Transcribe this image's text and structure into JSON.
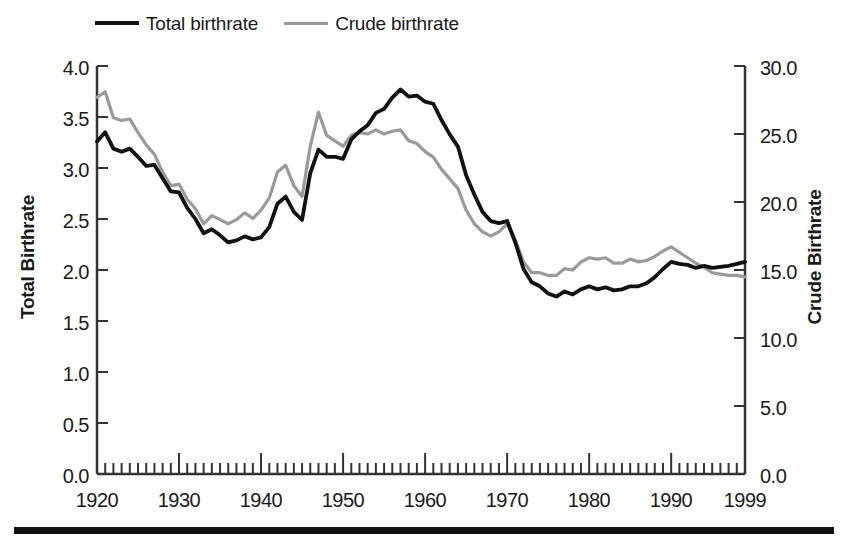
{
  "figure": {
    "background": "#ffffff",
    "bottom_rule_color": "#111111"
  },
  "legend": {
    "position": "top-left",
    "entries": [
      {
        "label": "Total birthrate",
        "color": "#111111",
        "swatch": "line-solid-black"
      },
      {
        "label": "Crude birthrate",
        "color": "#9a9a9a",
        "swatch": "line-solid-gray"
      }
    ]
  },
  "axes": {
    "y_left": {
      "title": "Total Birthrate",
      "ticks": [
        "0.0",
        "0.5",
        "1.0",
        "1.5",
        "2.0",
        "2.5",
        "3.0",
        "3.5",
        "4.0"
      ],
      "min": 0.0,
      "max": 4.0,
      "step": 0.5
    },
    "y_right": {
      "title": "Crude Birthrate",
      "ticks": [
        "0.0",
        "5.0",
        "10.0",
        "15.0",
        "20.0",
        "25.0",
        "30.0"
      ],
      "min": 0.0,
      "max": 30.0,
      "step": 5.0
    },
    "x": {
      "title": "",
      "ticks": [
        "1920",
        "1930",
        "1940",
        "1950",
        "1960",
        "1970",
        "1980",
        "1990",
        "1999"
      ],
      "min": 1920,
      "max": 1999,
      "minor_tick_interval": 1,
      "major_tick_interval": 10
    }
  },
  "chart_data": {
    "type": "line",
    "title": "",
    "subtitle": "",
    "xlabel": "",
    "ylabel": "Total Birthrate",
    "y2label": "Crude Birthrate",
    "xlim": [
      1920,
      1999
    ],
    "ylim": [
      0.0,
      4.0
    ],
    "y2lim": [
      0.0,
      30.0
    ],
    "grid": false,
    "legend_position": "top-left",
    "x": [
      1920,
      1921,
      1922,
      1923,
      1924,
      1925,
      1926,
      1927,
      1928,
      1929,
      1930,
      1931,
      1932,
      1933,
      1934,
      1935,
      1936,
      1937,
      1938,
      1939,
      1940,
      1941,
      1942,
      1943,
      1944,
      1945,
      1946,
      1947,
      1948,
      1949,
      1950,
      1951,
      1952,
      1953,
      1954,
      1955,
      1956,
      1957,
      1958,
      1959,
      1960,
      1961,
      1962,
      1963,
      1964,
      1965,
      1966,
      1967,
      1968,
      1969,
      1970,
      1971,
      1972,
      1973,
      1974,
      1975,
      1976,
      1977,
      1978,
      1979,
      1980,
      1981,
      1982,
      1983,
      1984,
      1985,
      1986,
      1987,
      1988,
      1989,
      1990,
      1991,
      1992,
      1993,
      1994,
      1995,
      1996,
      1997,
      1998,
      1999
    ],
    "series": [
      {
        "name": "Total birthrate",
        "axis": "left",
        "color": "#111111",
        "values": [
          3.26,
          3.35,
          3.19,
          3.16,
          3.19,
          3.11,
          3.02,
          3.03,
          2.9,
          2.77,
          2.76,
          2.61,
          2.5,
          2.36,
          2.4,
          2.34,
          2.27,
          2.29,
          2.33,
          2.3,
          2.32,
          2.42,
          2.65,
          2.72,
          2.57,
          2.49,
          2.95,
          3.18,
          3.11,
          3.11,
          3.09,
          3.28,
          3.36,
          3.42,
          3.54,
          3.58,
          3.69,
          3.77,
          3.7,
          3.71,
          3.65,
          3.63,
          3.47,
          3.33,
          3.21,
          2.93,
          2.74,
          2.57,
          2.48,
          2.46,
          2.48,
          2.27,
          2.01,
          1.88,
          1.84,
          1.77,
          1.74,
          1.79,
          1.76,
          1.81,
          1.84,
          1.81,
          1.83,
          1.8,
          1.81,
          1.84,
          1.84,
          1.87,
          1.93,
          2.01,
          2.08,
          2.06,
          2.05,
          2.02,
          2.04,
          2.02,
          2.03,
          2.04,
          2.06,
          2.08
        ]
      },
      {
        "name": "Crude birthrate",
        "axis": "right",
        "color": "#9a9a9a",
        "values": [
          27.7,
          28.1,
          26.2,
          26.0,
          26.1,
          25.1,
          24.2,
          23.5,
          22.2,
          21.2,
          21.3,
          20.2,
          19.5,
          18.4,
          19.0,
          18.7,
          18.4,
          18.7,
          19.2,
          18.8,
          19.4,
          20.3,
          22.2,
          22.7,
          21.2,
          20.4,
          24.1,
          26.6,
          24.9,
          24.5,
          24.1,
          24.9,
          25.1,
          25.0,
          25.3,
          25.0,
          25.2,
          25.3,
          24.5,
          24.3,
          23.7,
          23.3,
          22.4,
          21.7,
          21.0,
          19.4,
          18.4,
          17.8,
          17.5,
          17.8,
          18.4,
          17.2,
          15.6,
          14.8,
          14.8,
          14.6,
          14.6,
          15.1,
          15.0,
          15.6,
          15.9,
          15.8,
          15.9,
          15.5,
          15.5,
          15.8,
          15.6,
          15.7,
          16.0,
          16.4,
          16.7,
          16.3,
          15.9,
          15.5,
          15.2,
          14.8,
          14.7,
          14.6,
          14.6,
          14.5
        ]
      }
    ]
  }
}
